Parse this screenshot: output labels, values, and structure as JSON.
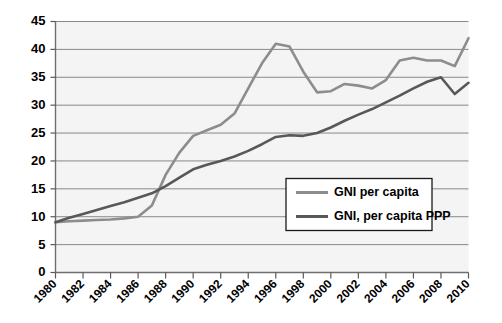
{
  "chart_data": {
    "type": "line",
    "title": "",
    "subtitle": "",
    "xlabel": "",
    "ylabel": "",
    "xlim": [
      1980,
      2010
    ],
    "ylim": [
      0,
      45
    ],
    "grid": true,
    "legend_position": "inside-center-right",
    "y_ticks": [
      0,
      5,
      10,
      15,
      20,
      25,
      30,
      35,
      40,
      45
    ],
    "y_tick_labels": [
      "0",
      "5",
      "10",
      "15",
      "20",
      "25",
      "30",
      "35",
      "40",
      "45"
    ],
    "x_ticks": [
      1980,
      1982,
      1984,
      1986,
      1988,
      1990,
      1992,
      1994,
      1996,
      1998,
      2000,
      2002,
      2004,
      2006,
      2008,
      2010
    ],
    "x_tick_labels": [
      "1980",
      "1982",
      "1984",
      "1986",
      "1988",
      "1990",
      "1992",
      "1994",
      "1996",
      "1998",
      "2000",
      "2002",
      "2004",
      "2006",
      "2008",
      "2010"
    ],
    "x": [
      1980,
      1981,
      1982,
      1983,
      1984,
      1985,
      1986,
      1987,
      1988,
      1989,
      1990,
      1991,
      1992,
      1993,
      1994,
      1995,
      1996,
      1997,
      1998,
      1999,
      2000,
      2001,
      2002,
      2003,
      2004,
      2005,
      2006,
      2007,
      2008,
      2009,
      2010
    ],
    "series": [
      {
        "name": "GNI per capita",
        "color": "#8d8d8d",
        "width": 2.6,
        "values": [
          9.0,
          9.2,
          9.3,
          9.4,
          9.5,
          9.7,
          10.0,
          12.0,
          17.5,
          21.5,
          24.5,
          25.5,
          26.5,
          28.5,
          33.0,
          37.5,
          41.0,
          40.5,
          36.0,
          32.3,
          32.5,
          33.8,
          33.5,
          33.0,
          34.5,
          38.0,
          38.5,
          38.0,
          38.0,
          37.0,
          42.0
        ]
      },
      {
        "name": "GNI, per capita PPP",
        "color": "#585858",
        "width": 2.6,
        "values": [
          9.0,
          9.8,
          10.5,
          11.2,
          11.9,
          12.6,
          13.4,
          14.2,
          15.5,
          17.0,
          18.5,
          19.3,
          20.0,
          20.8,
          21.8,
          23.0,
          24.3,
          24.6,
          24.5,
          25.0,
          26.0,
          27.2,
          28.3,
          29.3,
          30.5,
          31.7,
          33.0,
          34.2,
          35.0,
          32.0,
          34.0
        ]
      }
    ]
  },
  "legend": {
    "entries": [
      {
        "label": "GNI per capita",
        "color": "#8d8d8d"
      },
      {
        "label": "GNI, per capita PPP",
        "color": "#585858"
      }
    ]
  },
  "colors": {
    "plot_background": "#f4f4f4",
    "gridline": "#888888",
    "axis": "#6f6f6f",
    "text": "#000000",
    "page_background": "#ffffff"
  }
}
